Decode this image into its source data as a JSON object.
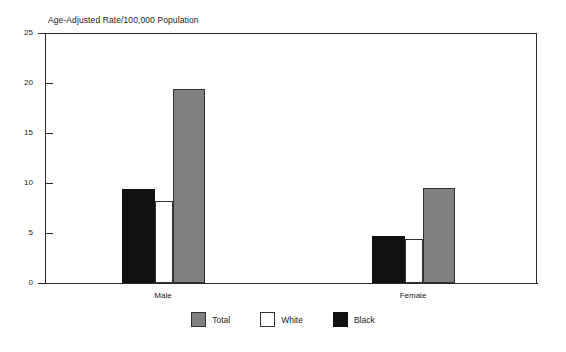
{
  "chart_data": {
    "type": "bar",
    "title": "Age-Adjusted Rate/100,000 Population",
    "xlabel": "",
    "ylabel": "",
    "categories": [
      "Male",
      "Female"
    ],
    "ylim": [
      0,
      25
    ],
    "yticks": [
      0,
      5,
      10,
      15,
      20,
      25
    ],
    "ytick_labels": [
      "0",
      "5",
      "10",
      "15",
      "20",
      "25"
    ],
    "grid": false,
    "legend_position": "bottom-center",
    "series": [
      {
        "name": "Total",
        "color": "#808080",
        "values": [
          19.4,
          9.5
        ]
      },
      {
        "name": "White",
        "color": "#ffffff",
        "values": [
          8.2,
          4.4
        ]
      },
      {
        "name": "Black",
        "color": "#111111",
        "values": [
          9.4,
          4.7
        ]
      }
    ],
    "draw_order": [
      "Black",
      "White",
      "Total"
    ]
  },
  "legend": {
    "items": [
      {
        "label": "Total",
        "swatch": "gray-swatch-icon"
      },
      {
        "label": "White",
        "swatch": "white-swatch-icon"
      },
      {
        "label": "Black",
        "swatch": "black-swatch-icon"
      }
    ]
  },
  "axis": {
    "y_labels": [
      "25",
      "20",
      "15",
      "10",
      "5",
      "0"
    ],
    "x_labels": [
      "Male",
      "Female"
    ]
  }
}
